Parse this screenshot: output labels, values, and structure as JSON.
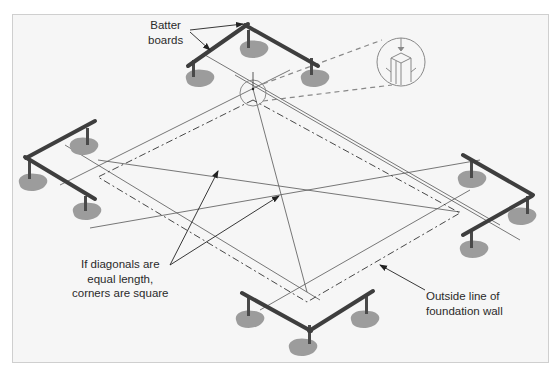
{
  "diagram": {
    "labels": {
      "batter_boards": [
        "Batter",
        "boards"
      ],
      "diagonals": [
        "If diagonals are",
        "equal length,",
        "corners are square"
      ],
      "foundation": [
        "Outside line of",
        "foundation wall"
      ]
    },
    "components": [
      "batter-board-top",
      "batter-board-left",
      "batter-board-right",
      "batter-board-bottom",
      "string-lines",
      "diagonal-lines",
      "foundation-outline-dashed",
      "plumb-bob-detail-callout"
    ],
    "colors": {
      "background": "#f6f6f6",
      "frame_border": "#cfcfcf",
      "board": "#4a4a4a",
      "soil": "#9a9a9a",
      "line": "#555555",
      "callout": "#8a8a8a",
      "text": "#2a2a2a"
    }
  }
}
